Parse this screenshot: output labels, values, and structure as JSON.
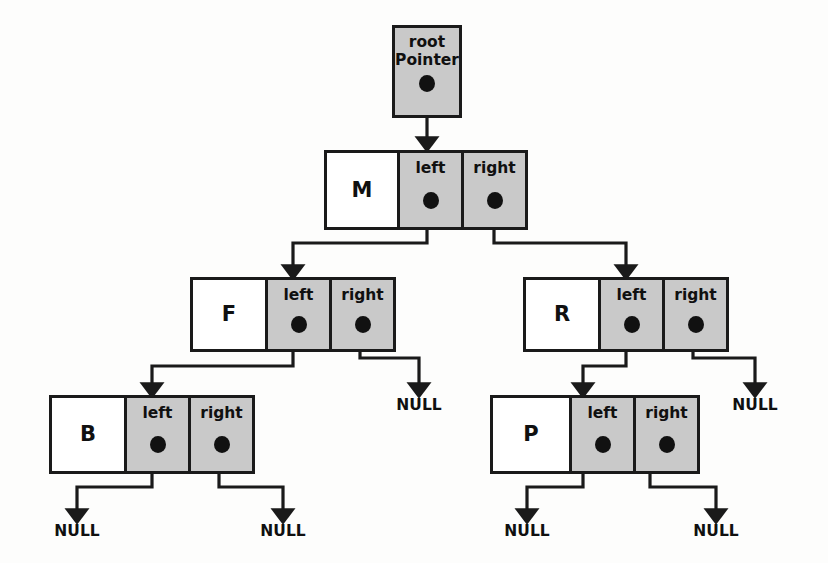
{
  "diagram": {
    "colors": {
      "background": "#fdfdfc",
      "stroke": "#1a1a1a",
      "pointer_cell_fill": "#c9c9c9",
      "value_cell_fill": "#ffffff",
      "dot_fill": "#111111"
    },
    "root_pointer": {
      "line1": "root",
      "line2": "Pointer",
      "dot": "pointer-dot"
    },
    "pointer_labels": {
      "left": "left",
      "right": "right"
    },
    "null_label": "NULL",
    "nodes": [
      {
        "id": "M",
        "value": "M",
        "left_label": "left",
        "right_label": "right",
        "level": 1
      },
      {
        "id": "F",
        "value": "F",
        "left_label": "left",
        "right_label": "right",
        "level": 2
      },
      {
        "id": "R",
        "value": "R",
        "left_label": "left",
        "right_label": "right",
        "level": 2
      },
      {
        "id": "B",
        "value": "B",
        "left_label": "left",
        "right_label": "right",
        "level": 3
      },
      {
        "id": "P",
        "value": "P",
        "left_label": "left",
        "right_label": "right",
        "level": 3
      }
    ],
    "nulls": [
      {
        "id": "null-f-right",
        "label": "NULL"
      },
      {
        "id": "null-r-right",
        "label": "NULL"
      },
      {
        "id": "null-b-left",
        "label": "NULL"
      },
      {
        "id": "null-b-right",
        "label": "NULL"
      },
      {
        "id": "null-p-left",
        "label": "NULL"
      },
      {
        "id": "null-p-right",
        "label": "NULL"
      }
    ],
    "edges": [
      {
        "from": "root-pointer",
        "to": "M"
      },
      {
        "from": "M.left",
        "to": "F"
      },
      {
        "from": "M.right",
        "to": "R"
      },
      {
        "from": "F.left",
        "to": "B"
      },
      {
        "from": "F.right",
        "to": "null-f-right"
      },
      {
        "from": "R.left",
        "to": "P"
      },
      {
        "from": "R.right",
        "to": "null-r-right"
      },
      {
        "from": "B.left",
        "to": "null-b-left"
      },
      {
        "from": "B.right",
        "to": "null-b-right"
      },
      {
        "from": "P.left",
        "to": "null-p-left"
      },
      {
        "from": "P.right",
        "to": "null-p-right"
      }
    ]
  }
}
